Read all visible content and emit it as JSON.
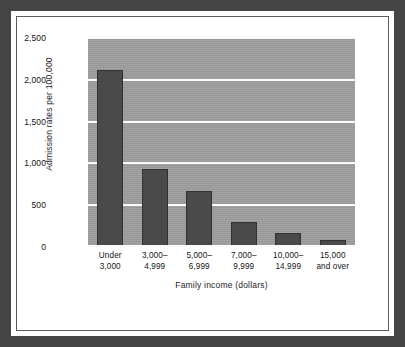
{
  "chart_data": {
    "type": "bar",
    "title": "",
    "xlabel": "Family income (dollars)",
    "ylabel": "Admission rates per 100,000",
    "categories": [
      "Under\n3,000",
      "3,000–\n4,999",
      "5,000–\n6,999",
      "7,000–\n9,999",
      "10,000–\n14,999",
      "15,000\nand over"
    ],
    "values": [
      2120,
      930,
      665,
      300,
      170,
      80
    ],
    "ylim": [
      0,
      2500
    ],
    "ytick_values": [
      0,
      500,
      1000,
      1500,
      2000,
      2500
    ],
    "ytick_labels": [
      "0",
      "500",
      "1,000",
      "1,500",
      "2,000",
      "2,500"
    ],
    "grid": true,
    "legend": "none",
    "bar_color": "#4a4a4a",
    "plot_background_color": "#9e9e9e",
    "gridline_color": "#fbfbfb",
    "frame_color": "#454545",
    "canvas_color": "#ffffff"
  }
}
